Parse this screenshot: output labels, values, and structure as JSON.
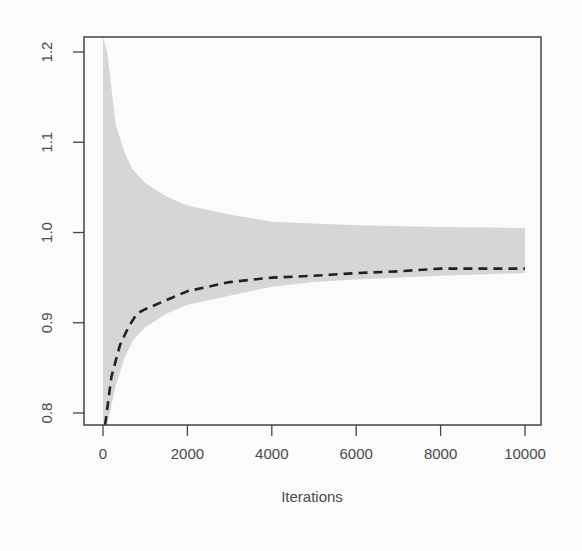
{
  "chart_data": {
    "type": "line",
    "title": "",
    "xlabel": "Iterations",
    "ylabel": "",
    "xlim": [
      0,
      10000
    ],
    "ylim": [
      0.8,
      1.2
    ],
    "x_ticks": [
      0,
      2000,
      4000,
      6000,
      8000,
      10000
    ],
    "x_tick_labels": [
      "0",
      "2000",
      "4000",
      "6000",
      "8000",
      "10000"
    ],
    "y_ticks": [
      0.8,
      0.9,
      1.0,
      1.1,
      1.2
    ],
    "y_tick_labels": [
      "0.8",
      "0.9",
      "1.0",
      "1.1",
      "1.2"
    ],
    "grid": false,
    "legend": null,
    "series": [
      {
        "name": "running mean",
        "style": "dashed",
        "color": "#222222",
        "x": [
          50,
          200,
          400,
          600,
          800,
          1000,
          1500,
          2000,
          2500,
          3000,
          4000,
          5000,
          6000,
          7000,
          8000,
          9000,
          10000
        ],
        "values": [
          0.785,
          0.84,
          0.875,
          0.895,
          0.91,
          0.915,
          0.925,
          0.935,
          0.94,
          0.945,
          0.95,
          0.952,
          0.955,
          0.957,
          0.96,
          0.96,
          0.96
        ]
      },
      {
        "name": "band upper",
        "style": "filled-area",
        "color": "#d6d6d6",
        "x": [
          0,
          100,
          300,
          500,
          700,
          1000,
          1500,
          2000,
          3000,
          4000,
          5000,
          6000,
          8000,
          10000
        ],
        "values": [
          1.22,
          1.2,
          1.12,
          1.09,
          1.07,
          1.055,
          1.04,
          1.03,
          1.02,
          1.012,
          1.01,
          1.008,
          1.006,
          1.005
        ]
      },
      {
        "name": "band lower",
        "style": "filled-area",
        "color": "#d6d6d6",
        "x": [
          0,
          100,
          300,
          500,
          700,
          1000,
          1500,
          2000,
          3000,
          4000,
          5000,
          6000,
          8000,
          10000
        ],
        "values": [
          0.785,
          0.785,
          0.83,
          0.86,
          0.88,
          0.895,
          0.91,
          0.92,
          0.93,
          0.94,
          0.945,
          0.948,
          0.952,
          0.955
        ]
      }
    ]
  }
}
